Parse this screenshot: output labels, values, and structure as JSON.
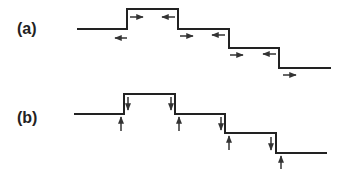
{
  "figure": {
    "panels": [
      {
        "label": "(a)",
        "arrow_orientation": "horizontal",
        "description": "staircase profile with horizontal arrows on each terrace",
        "arrows": [
          "left",
          "right",
          "left",
          "right",
          "left",
          "right",
          "left",
          "right"
        ]
      },
      {
        "label": "(b)",
        "arrow_orientation": "vertical",
        "description": "staircase profile with vertical arrows at each step edge",
        "arrows": [
          "up",
          "down",
          "down",
          "up",
          "down",
          "up",
          "down",
          "up"
        ]
      }
    ]
  },
  "colors": {
    "line": "#222222",
    "arrow": "#333333",
    "background": "#ffffff"
  }
}
